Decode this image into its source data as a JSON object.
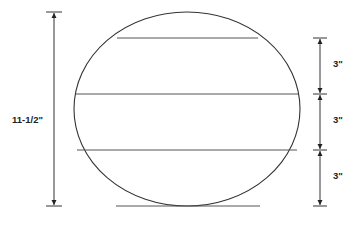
{
  "diagram": {
    "title": "",
    "colors": {
      "stroke": "#333333",
      "chord": "#555555",
      "text": "#222222",
      "background": "#ffffff"
    },
    "overall_dimension": {
      "label": "11-1/2\""
    },
    "segment_dimensions": [
      {
        "label": "3\""
      },
      {
        "label": "3\""
      },
      {
        "label": "3\""
      }
    ],
    "shape": "circle-with-parallel-chords",
    "chord_count": 4
  }
}
